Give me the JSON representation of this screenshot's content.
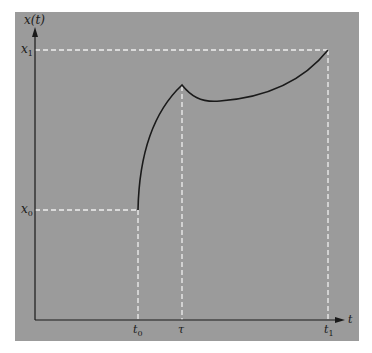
{
  "figure": {
    "y_axis_label": "x(t)",
    "x_axis_label": "t",
    "y_ticks": [
      {
        "label": "x",
        "sub": "1",
        "value": "x1"
      },
      {
        "label": "x",
        "sub": "0",
        "value": "x0"
      }
    ],
    "x_ticks": [
      {
        "label": "t",
        "sub": "0",
        "value": "t0"
      },
      {
        "label": "τ",
        "sub": "",
        "value": "tau"
      },
      {
        "label": "t",
        "sub": "1",
        "value": "t1"
      }
    ],
    "colors": {
      "panel": "#9b9b9b",
      "axes": "#1a1a1a",
      "curve": "#1a1a1a",
      "guides": "#f0f0f0"
    },
    "curve_description": "Trajectory starts at (t0, x0), rises steeply to a corner peak at t = τ, dips slightly, then rises to x1 at t1."
  }
}
